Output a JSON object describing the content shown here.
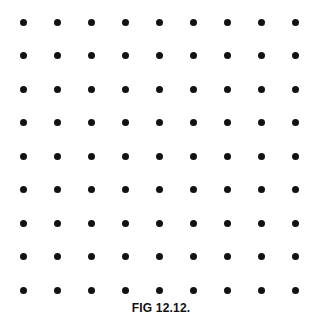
{
  "figure": {
    "caption": "FIG 12.12.",
    "background_color": "#ffffff",
    "dot_color": "#121212",
    "caption_color": "#111111"
  },
  "chart_data": {
    "type": "scatter",
    "title": "FIG 12.12.",
    "subtitle": "",
    "xlabel": "",
    "ylabel": "",
    "grid": false,
    "legend": null,
    "rows": 9,
    "columns": 9,
    "point_count": 81,
    "marker": {
      "shape": "circle",
      "filled": true,
      "diameter_px": 7,
      "color": "#121212"
    },
    "layout": {
      "origin_x_px": 23,
      "origin_y_px": 22,
      "column_spacing_px": 34.1,
      "row_spacing_px": 33.5,
      "caption_baseline_y_px": 314
    },
    "axis_ranges": {
      "xlim": [
        0,
        8
      ],
      "ylim": [
        0,
        8
      ]
    },
    "x": [
      0,
      1,
      2,
      3,
      4,
      5,
      6,
      7,
      8
    ],
    "y": [
      0,
      1,
      2,
      3,
      4,
      5,
      6,
      7,
      8
    ],
    "points": [
      {
        "x": 0,
        "y": 8
      },
      {
        "x": 1,
        "y": 8
      },
      {
        "x": 2,
        "y": 8
      },
      {
        "x": 3,
        "y": 8
      },
      {
        "x": 4,
        "y": 8
      },
      {
        "x": 5,
        "y": 8
      },
      {
        "x": 6,
        "y": 8
      },
      {
        "x": 7,
        "y": 8
      },
      {
        "x": 8,
        "y": 8
      },
      {
        "x": 0,
        "y": 7
      },
      {
        "x": 1,
        "y": 7
      },
      {
        "x": 2,
        "y": 7
      },
      {
        "x": 3,
        "y": 7
      },
      {
        "x": 4,
        "y": 7
      },
      {
        "x": 5,
        "y": 7
      },
      {
        "x": 6,
        "y": 7
      },
      {
        "x": 7,
        "y": 7
      },
      {
        "x": 8,
        "y": 7
      },
      {
        "x": 0,
        "y": 6
      },
      {
        "x": 1,
        "y": 6
      },
      {
        "x": 2,
        "y": 6
      },
      {
        "x": 3,
        "y": 6
      },
      {
        "x": 4,
        "y": 6
      },
      {
        "x": 5,
        "y": 6
      },
      {
        "x": 6,
        "y": 6
      },
      {
        "x": 7,
        "y": 6
      },
      {
        "x": 8,
        "y": 6
      },
      {
        "x": 0,
        "y": 5
      },
      {
        "x": 1,
        "y": 5
      },
      {
        "x": 2,
        "y": 5
      },
      {
        "x": 3,
        "y": 5
      },
      {
        "x": 4,
        "y": 5
      },
      {
        "x": 5,
        "y": 5
      },
      {
        "x": 6,
        "y": 5
      },
      {
        "x": 7,
        "y": 5
      },
      {
        "x": 8,
        "y": 5
      },
      {
        "x": 0,
        "y": 4
      },
      {
        "x": 1,
        "y": 4
      },
      {
        "x": 2,
        "y": 4
      },
      {
        "x": 3,
        "y": 4
      },
      {
        "x": 4,
        "y": 4
      },
      {
        "x": 5,
        "y": 4
      },
      {
        "x": 6,
        "y": 4
      },
      {
        "x": 7,
        "y": 4
      },
      {
        "x": 8,
        "y": 4
      },
      {
        "x": 0,
        "y": 3
      },
      {
        "x": 1,
        "y": 3
      },
      {
        "x": 2,
        "y": 3
      },
      {
        "x": 3,
        "y": 3
      },
      {
        "x": 4,
        "y": 3
      },
      {
        "x": 5,
        "y": 3
      },
      {
        "x": 6,
        "y": 3
      },
      {
        "x": 7,
        "y": 3
      },
      {
        "x": 8,
        "y": 3
      },
      {
        "x": 0,
        "y": 2
      },
      {
        "x": 1,
        "y": 2
      },
      {
        "x": 2,
        "y": 2
      },
      {
        "x": 3,
        "y": 2
      },
      {
        "x": 4,
        "y": 2
      },
      {
        "x": 5,
        "y": 2
      },
      {
        "x": 6,
        "y": 2
      },
      {
        "x": 7,
        "y": 2
      },
      {
        "x": 8,
        "y": 2
      },
      {
        "x": 0,
        "y": 1
      },
      {
        "x": 1,
        "y": 1
      },
      {
        "x": 2,
        "y": 1
      },
      {
        "x": 3,
        "y": 1
      },
      {
        "x": 4,
        "y": 1
      },
      {
        "x": 5,
        "y": 1
      },
      {
        "x": 6,
        "y": 1
      },
      {
        "x": 7,
        "y": 1
      },
      {
        "x": 8,
        "y": 1
      },
      {
        "x": 0,
        "y": 0
      },
      {
        "x": 1,
        "y": 0
      },
      {
        "x": 2,
        "y": 0
      },
      {
        "x": 3,
        "y": 0
      },
      {
        "x": 4,
        "y": 0
      },
      {
        "x": 5,
        "y": 0
      },
      {
        "x": 6,
        "y": 0
      },
      {
        "x": 7,
        "y": 0
      },
      {
        "x": 8,
        "y": 0
      }
    ]
  }
}
